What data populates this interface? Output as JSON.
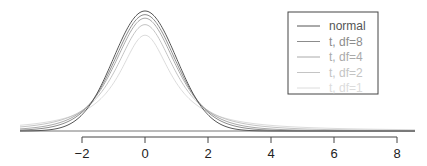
{
  "chart_data": {
    "type": "line",
    "title": "",
    "xlabel": "",
    "ylabel": "",
    "xlim": [
      -4,
      8
    ],
    "axis_ticks": [
      -2,
      0,
      2,
      4,
      6,
      8
    ],
    "tick_labels": [
      "−2",
      "0",
      "2",
      "4",
      "6",
      "8"
    ],
    "grid": false,
    "legend_position": "top-right",
    "series": [
      {
        "name": "normal",
        "df": null,
        "color": "#555555"
      },
      {
        "name": "t, df=8",
        "df": 8,
        "color": "#8c8c8c"
      },
      {
        "name": "t, df=4",
        "df": 4,
        "color": "#aaaaaa"
      },
      {
        "name": "t, df=2",
        "df": 2,
        "color": "#c4c4c4"
      },
      {
        "name": "t, df=1",
        "df": 1,
        "color": "#dcdcdc"
      }
    ],
    "peak_values": {
      "normal": 0.399,
      "t, df=8": 0.387,
      "t, df=4": 0.375,
      "t, df=2": 0.354,
      "t, df=1": 0.318
    }
  },
  "legend": {
    "items": [
      "normal",
      "t, df=8",
      "t, df=4",
      "t, df=2",
      "t, df=1"
    ]
  }
}
